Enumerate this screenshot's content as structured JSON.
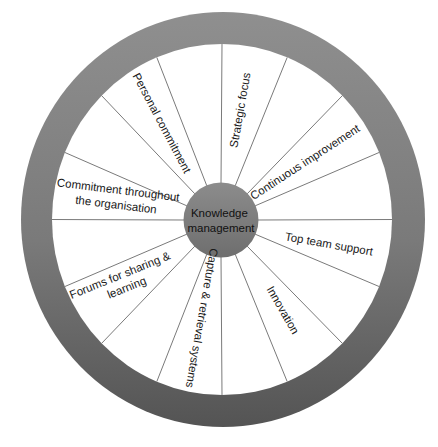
{
  "diagram": {
    "type": "wheel",
    "hub": {
      "lines": [
        "Knowledge",
        "management"
      ]
    },
    "spoke_count": 16,
    "segments": [
      {
        "id": "strategic-focus",
        "lines": [
          "Strategic focus"
        ],
        "cx": 240,
        "cy": 110,
        "rotate": -80
      },
      {
        "id": "continuous-improvement",
        "lines": [
          "Continuous improvement"
        ],
        "cx": 305,
        "cy": 162,
        "rotate": -33
      },
      {
        "id": "top-team-support",
        "lines": [
          "Top team support"
        ],
        "cx": 329,
        "cy": 244,
        "rotate": 10
      },
      {
        "id": "innovation",
        "lines": [
          "Innovation"
        ],
        "cx": 283,
        "cy": 310,
        "rotate": 60
      },
      {
        "id": "capture-retrieval-systems",
        "lines": [
          "Capture & retrieval systems"
        ],
        "cx": 202,
        "cy": 318,
        "rotate": 100
      },
      {
        "id": "forums-sharing-learning",
        "lines": [
          "Forums for sharing &",
          "learning"
        ],
        "cx": 124,
        "cy": 281,
        "rotate": -22
      },
      {
        "id": "commitment-throughout-organisation",
        "lines": [
          "Commitment throughout",
          "the organisation"
        ],
        "cx": 119,
        "cy": 197,
        "rotate": 7
      },
      {
        "id": "personal-commitment",
        "lines": [
          "Personal commitment"
        ],
        "cx": 162,
        "cy": 123,
        "rotate": 62
      }
    ],
    "colors": {
      "rim_top": "#8f8f8f",
      "rim_bottom": "#545454",
      "hub_top": "#8c8c8c",
      "hub_bottom": "#6e6e6e",
      "spoke": "#7a7a7a",
      "segment_fill": "#ffffff"
    }
  }
}
